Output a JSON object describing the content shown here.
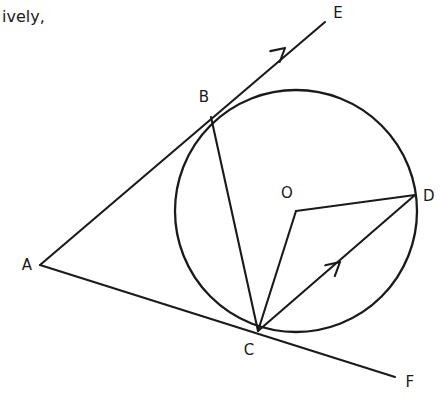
{
  "page": {
    "caption_fragment": "ively,",
    "background_color": "#ffffff",
    "ink_color": "#1a1a1a",
    "width": 441,
    "height": 400
  },
  "figure": {
    "circle": {
      "center_label": "O",
      "center_x": 296,
      "center_y": 211,
      "radius": 121
    },
    "points": [
      {
        "label": "A",
        "x": 40,
        "y": 265,
        "label_x": 27,
        "label_y": 265,
        "role": "external-vertex"
      },
      {
        "label": "B",
        "x": 211,
        "y": 117,
        "label_x": 204,
        "label_y": 97,
        "role": "tangent-point"
      },
      {
        "label": "C",
        "x": 258,
        "y": 331,
        "label_x": 249,
        "label_y": 350,
        "role": "tangent-point"
      },
      {
        "label": "D",
        "x": 415,
        "y": 195,
        "label_x": 429,
        "label_y": 196,
        "role": "circle-point"
      },
      {
        "label": "E",
        "x": 325,
        "y": 22,
        "label_x": 338,
        "label_y": 13,
        "role": "ray-end"
      },
      {
        "label": "F",
        "x": 395,
        "y": 377,
        "label_x": 410,
        "label_y": 382,
        "role": "ray-end"
      },
      {
        "label": "O",
        "x": 296,
        "y": 211,
        "label_x": 287,
        "label_y": 193,
        "role": "center"
      }
    ],
    "segments": [
      {
        "name": "ray-A-B-E",
        "from": "A",
        "to": "E",
        "x1": 40,
        "y1": 265,
        "x2": 325,
        "y2": 22,
        "arrow": true
      },
      {
        "name": "ray-A-C-F",
        "from": "A",
        "to": "F",
        "x1": 40,
        "y1": 265,
        "x2": 395,
        "y2": 377,
        "arrow": false
      },
      {
        "name": "chord-B-C",
        "from": "B",
        "to": "C",
        "x1": 211,
        "y1": 117,
        "x2": 258,
        "y2": 331,
        "arrow": false
      },
      {
        "name": "radius-O-C",
        "from": "O",
        "to": "C",
        "x1": 296,
        "y1": 211,
        "x2": 258,
        "y2": 331,
        "arrow": false
      },
      {
        "name": "radius-O-D",
        "from": "O",
        "to": "D",
        "x1": 296,
        "y1": 211,
        "x2": 415,
        "y2": 195,
        "arrow": false
      },
      {
        "name": "ray-C-D",
        "from": "C",
        "to": "D",
        "x1": 258,
        "y1": 331,
        "x2": 415,
        "y2": 195,
        "arrow": true
      }
    ],
    "arrowheads": [
      {
        "name": "arrowhead-on-ray-AE",
        "x": 285,
        "y": 48,
        "angle_deg": -40.5
      },
      {
        "name": "arrowhead-on-ray-CD",
        "x": 340,
        "y": 262,
        "angle_deg": -40.9
      }
    ]
  }
}
